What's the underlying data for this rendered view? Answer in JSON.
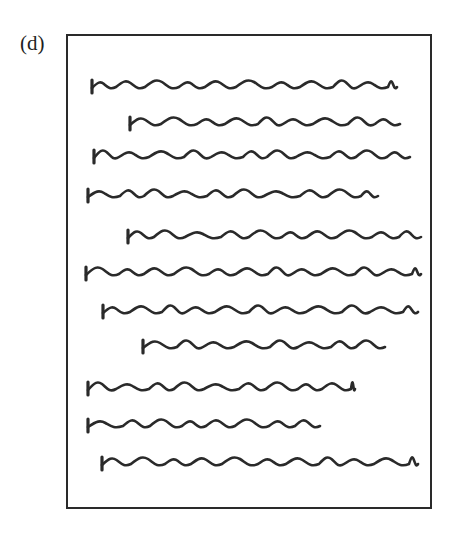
{
  "figure": {
    "label": "(d)",
    "stroke_color": "#2a2a2a",
    "lines": [
      {
        "x1": 92,
        "x2": 397,
        "y": 88
      },
      {
        "x1": 130,
        "x2": 400,
        "y": 125
      },
      {
        "x1": 94,
        "x2": 410,
        "y": 158
      },
      {
        "x1": 88,
        "x2": 378,
        "y": 197
      },
      {
        "x1": 128,
        "x2": 421,
        "y": 238
      },
      {
        "x1": 86,
        "x2": 421,
        "y": 275
      },
      {
        "x1": 103,
        "x2": 418,
        "y": 313
      },
      {
        "x1": 143,
        "x2": 385,
        "y": 348
      },
      {
        "x1": 88,
        "x2": 355,
        "y": 390
      },
      {
        "x1": 88,
        "x2": 320,
        "y": 427
      },
      {
        "x1": 102,
        "x2": 418,
        "y": 465
      }
    ]
  }
}
